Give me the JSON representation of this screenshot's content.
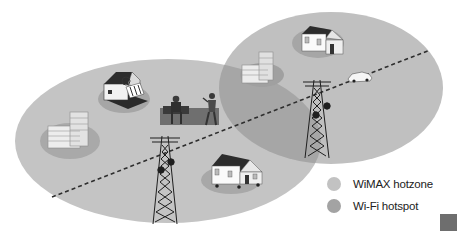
{
  "colors": {
    "wimax_hotzone": "#c2c2c2",
    "wifi_hotspot": "#a3a3a3",
    "overlap": "#a8a8a8",
    "background": "#ffffff",
    "road_dash": "#333333",
    "corner_square": "#6e6e6e"
  },
  "legend": {
    "items": [
      {
        "label": "WiMAX hotzone",
        "color": "#c2c2c2",
        "icon": "wimax-hotzone-dot"
      },
      {
        "label": "Wi-Fi hotspot",
        "color": "#a3a3a3",
        "icon": "wifi-hotspot-dot"
      }
    ]
  },
  "diagram": {
    "zones": [
      {
        "name": "left-wimax-hotzone",
        "type": "ellipse"
      },
      {
        "name": "right-wimax-hotzone",
        "type": "ellipse"
      },
      {
        "name": "wifi-hotspot-overlap",
        "type": "overlap"
      }
    ],
    "icons": [
      "office-building-icon-left",
      "shop-icon",
      "people-bench-icon",
      "cell-tower-icon-left",
      "house-icon-bottom",
      "office-building-icon-right",
      "house-icon-top",
      "car-icon",
      "cell-tower-icon-right"
    ],
    "road": "dashed-road-line"
  }
}
